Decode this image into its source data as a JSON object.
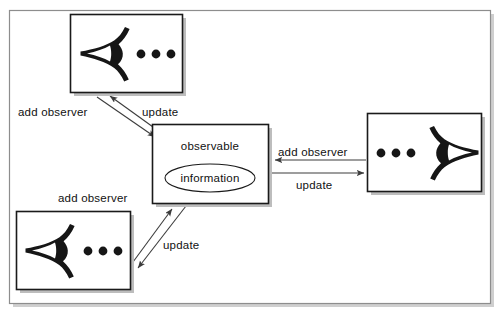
{
  "figure": {
    "frame": {
      "stroke": "#8d8d8d",
      "shadow": "#c9c9c9",
      "background": "#ffffff"
    },
    "palette": {
      "box_stroke": "#1a1a1a",
      "box_fill": "#ffffff",
      "box_shadow": "#b8b8b8",
      "arrow_stroke": "#3c3c3c",
      "ink": "#111111",
      "icon_fill": "#161616"
    }
  },
  "subject": {
    "name": "observable-node",
    "title": "observable",
    "data_label": "information"
  },
  "observers": [
    {
      "name": "observer-top-left",
      "icon": "observer-eye-icon",
      "dots": 3,
      "facing": "left"
    },
    {
      "name": "observer-right",
      "icon": "observer-eye-icon",
      "dots": 3,
      "facing": "right"
    },
    {
      "name": "observer-bottom-left",
      "icon": "observer-eye-icon",
      "dots": 3,
      "facing": "left"
    }
  ],
  "edges": [
    {
      "name": "edge-add-observer-top",
      "label": "add observer",
      "from": "observer-top-left",
      "to": "observable-node",
      "direction": "to-subject"
    },
    {
      "name": "edge-update-top",
      "label": "update",
      "from": "observable-node",
      "to": "observer-top-left",
      "direction": "to-observer"
    },
    {
      "name": "edge-add-observer-right",
      "label": "add observer",
      "from": "observer-right",
      "to": "observable-node",
      "direction": "to-subject"
    },
    {
      "name": "edge-update-right",
      "label": "update",
      "from": "observable-node",
      "to": "observer-right",
      "direction": "to-observer"
    },
    {
      "name": "edge-add-observer-bottom",
      "label": "add observer",
      "from": "observer-bottom-left",
      "to": "observable-node",
      "direction": "to-subject"
    },
    {
      "name": "edge-update-bottom",
      "label": "update",
      "from": "observable-node",
      "to": "observer-bottom-left",
      "direction": "to-observer"
    }
  ],
  "labels": {
    "add_observer_top": "add observer",
    "update_top": "update",
    "add_observer_right": "add observer",
    "update_right": "update",
    "add_observer_bottom": "add observer",
    "update_bottom": "update",
    "observable": "observable",
    "information": "information"
  }
}
